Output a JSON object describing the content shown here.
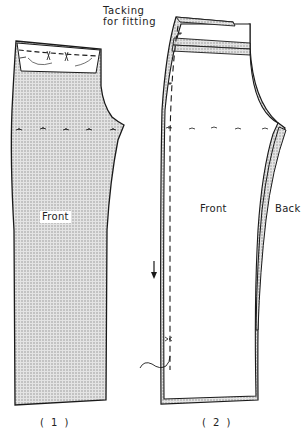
{
  "title": {
    "line1": "Tacking",
    "line2": "for fitting"
  },
  "figures": [
    {
      "id": 1,
      "caption": "( 1 )",
      "piece_label": "Front",
      "fill": "stippled",
      "annotations": [
        "waist dart tacking",
        "knee line tacking marks"
      ]
    },
    {
      "id": 2,
      "caption": "( 2 )",
      "piece_labels": [
        "Front",
        "Back"
      ],
      "annotations": [
        "side seam tacking (dashed)",
        "direction arrow",
        "thread end",
        "waistband layers",
        "knee line tacking marks"
      ]
    }
  ],
  "colors": {
    "line": "#1a1a1a",
    "stipple": "#b8b8b8",
    "background": "#ffffff"
  }
}
